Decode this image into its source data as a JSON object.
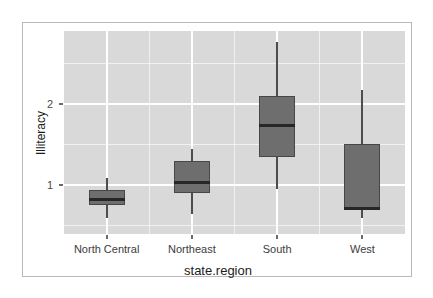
{
  "figure": {
    "background_color": "#ffffff",
    "frame_border_color": "#b9b9bd",
    "panel_background_color": "#d9d9d9",
    "grid_color": "#ffffff",
    "box_fill_color": "#6e6e6e",
    "box_border_color": "#474747",
    "median_color": "#262626",
    "whisker_color": "#4d4d4d"
  },
  "chart_data": {
    "type": "box",
    "title": "",
    "xlabel": "state.region",
    "ylabel": "Illiteracy",
    "categories": [
      "North Central",
      "Northeast",
      "South",
      "West"
    ],
    "ylim": [
      0.4,
      2.9
    ],
    "yticks": [
      1,
      2
    ],
    "ytick_labels": [
      "1",
      "2"
    ],
    "yminor_ticks": [
      0.5,
      1.5,
      2.5
    ],
    "grid": true,
    "legend": "none",
    "boxes": [
      {
        "category": "North Central",
        "whisker_low": 0.6,
        "q1": 0.76,
        "median": 0.83,
        "q3": 0.94,
        "whisker_high": 1.09
      },
      {
        "category": "Northeast",
        "whisker_low": 0.65,
        "q1": 0.9,
        "median": 1.03,
        "q3": 1.3,
        "whisker_high": 1.45
      },
      {
        "category": "South",
        "whisker_low": 0.96,
        "q1": 1.35,
        "median": 1.74,
        "q3": 2.1,
        "whisker_high": 2.77
      },
      {
        "category": "West",
        "whisker_low": 0.6,
        "q1": 0.71,
        "median": 0.71,
        "q3": 1.51,
        "whisker_high": 2.17
      }
    ]
  }
}
